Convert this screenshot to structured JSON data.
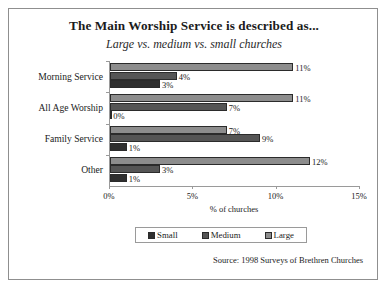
{
  "chart_data": {
    "type": "bar",
    "orientation": "horizontal",
    "grouped": true,
    "title": "The Main Worship Service is described as...",
    "subtitle": "Large vs. medium vs. small churches",
    "xlabel": "% of churches",
    "ylabel": "",
    "xlim": [
      0,
      15
    ],
    "xticks": [
      "0%",
      "5%",
      "10%",
      "15%"
    ],
    "xtick_values": [
      0,
      5,
      10,
      15
    ],
    "grid": false,
    "legend_position": "bottom",
    "categories": [
      "Morning Service",
      "All Age Worship",
      "Family Service",
      "Other"
    ],
    "series": [
      {
        "name": "Large",
        "color": "#8d8d8d",
        "values": [
          11,
          11,
          7,
          12
        ],
        "labels": [
          "11%",
          "11%",
          "7%",
          "12%"
        ]
      },
      {
        "name": "Medium",
        "color": "#555555",
        "values": [
          4,
          7,
          9,
          3
        ],
        "labels": [
          "4%",
          "7%",
          "9%",
          "3%"
        ]
      },
      {
        "name": "Small",
        "color": "#2f2f2f",
        "values": [
          3,
          0,
          1,
          1
        ],
        "labels": [
          "3%",
          "0%",
          "1%",
          "1%"
        ]
      }
    ],
    "source": "Source: 1998 Surveys of Brethren Churches"
  },
  "legend": {
    "items": [
      {
        "label": "Small",
        "color": "#2f2f2f"
      },
      {
        "label": "Medium",
        "color": "#555555"
      },
      {
        "label": "Large",
        "color": "#8d8d8d"
      }
    ]
  }
}
